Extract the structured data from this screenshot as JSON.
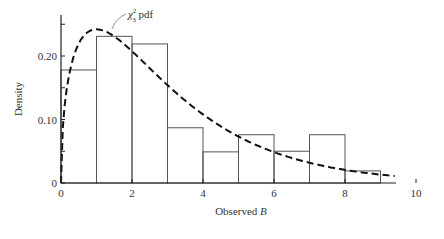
{
  "chart_data": {
    "type": "bar",
    "title": "",
    "xlabel": "Observed B",
    "xlabel_text": "Observed ",
    "xlabel_var": "B",
    "ylabel": "Density",
    "xlim": [
      0,
      10.5
    ],
    "ylim": [
      0,
      0.265
    ],
    "xticks": [
      0,
      2,
      4,
      6,
      8,
      10
    ],
    "xtick_labels": [
      "0",
      "2",
      "4",
      "6",
      "8",
      "10"
    ],
    "yticks": [
      0,
      0.05,
      0.1,
      0.15,
      0.2,
      0.25
    ],
    "ytick_labels": [
      "0",
      "",
      "0.10",
      "",
      "0.20",
      ""
    ],
    "grid": false,
    "histogram": {
      "bin_edges": [
        0,
        1,
        2,
        3,
        4,
        5,
        6,
        7,
        8,
        9
      ],
      "values": [
        0.178,
        0.231,
        0.219,
        0.087,
        0.049,
        0.076,
        0.05,
        0.076,
        0.019
      ]
    },
    "series": [
      {
        "name": "chi-squared 3 df pdf",
        "style": "dashed",
        "function": "chi2_pdf",
        "df": 3
      }
    ],
    "annotations": [
      {
        "text": "χ²₃ pdf",
        "base": "χ",
        "sup": "2",
        "sub": "3",
        "suffix": " pdf",
        "x": 1.5,
        "y": 0.239
      }
    ]
  }
}
